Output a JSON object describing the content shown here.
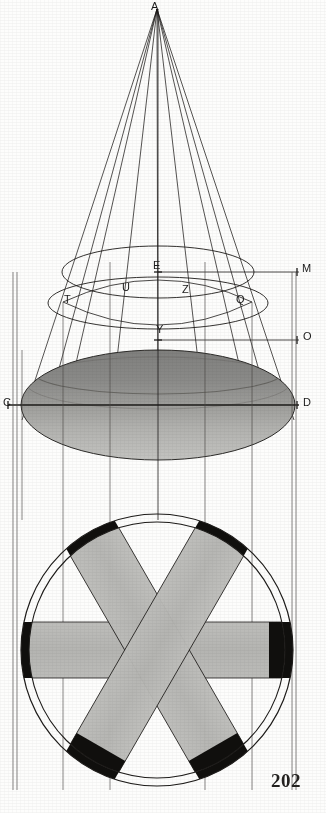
{
  "page": {
    "folio": "202",
    "background_color": "#fdfdfc",
    "ink_color": "#1d1b19",
    "width": 326,
    "height": 813
  },
  "figure": {
    "kind": "geometric-engraving",
    "views": [
      {
        "name": "elevation",
        "description": "cone with apex A, two ellipse sections and shaded elliptical base"
      },
      {
        "name": "plan",
        "description": "two concentric circles with three crossing bands and black arc segments"
      }
    ]
  },
  "labels": [
    {
      "text": "A",
      "x": 151,
      "y": 1,
      "name": "label-A",
      "note": "cone apex"
    },
    {
      "text": "E",
      "x": 153,
      "y": 260,
      "name": "label-E"
    },
    {
      "text": "M",
      "x": 302,
      "y": 263,
      "name": "label-M"
    },
    {
      "text": "U",
      "x": 122,
      "y": 282,
      "name": "label-U"
    },
    {
      "text": "Z",
      "x": 182,
      "y": 284,
      "name": "label-Z"
    },
    {
      "text": "T",
      "x": 64,
      "y": 294,
      "name": "label-T"
    },
    {
      "text": "Q",
      "x": 236,
      "y": 294,
      "name": "label-Q"
    },
    {
      "text": "Y",
      "x": 156,
      "y": 324,
      "name": "label-Y"
    },
    {
      "text": "O",
      "x": 303,
      "y": 331,
      "name": "label-O"
    },
    {
      "text": "C",
      "x": 3,
      "y": 397,
      "name": "label-C"
    },
    {
      "text": "D",
      "x": 303,
      "y": 397,
      "name": "label-D"
    }
  ],
  "folio_pos": {
    "x": 271,
    "y": 770
  },
  "elevation": {
    "apex": {
      "x": 157,
      "y": 8
    },
    "generators_x_at_base": [
      22,
      45,
      62,
      110,
      205,
      252,
      273,
      295
    ],
    "upper_ellipse": {
      "cx": 158,
      "cy": 272,
      "rx": 97,
      "ry": 26
    },
    "middle_ellipse": {
      "cx": 158,
      "cy": 303,
      "rx": 110,
      "ry": 27
    },
    "base_ellipse": {
      "cx": 158,
      "cy": 405,
      "rx": 137,
      "ry": 55
    },
    "horizontals": [
      {
        "name": "line-EM",
        "y": 272,
        "x1": 158,
        "x2": 300
      },
      {
        "name": "line-YO",
        "y": 340,
        "x1": 158,
        "x2": 300
      },
      {
        "name": "line-CD",
        "y": 405,
        "x1": 8,
        "x2": 300
      }
    ],
    "base_shade_top": "#8d8d8b",
    "base_shade_bottom": "#b9b9b6"
  },
  "plan": {
    "center": {
      "x": 157,
      "y": 650
    },
    "outer_radius": 136,
    "inner_radius": 128,
    "band_half_width": 28,
    "band_angles_deg": [
      0,
      60,
      120
    ],
    "band_fill": "#b8b8b5",
    "cap_fill": "#100f0d",
    "stroke": "#1d1b19"
  },
  "projection_lines_x": [
    13,
    17,
    22,
    63,
    110,
    205,
    252,
    292,
    296
  ]
}
